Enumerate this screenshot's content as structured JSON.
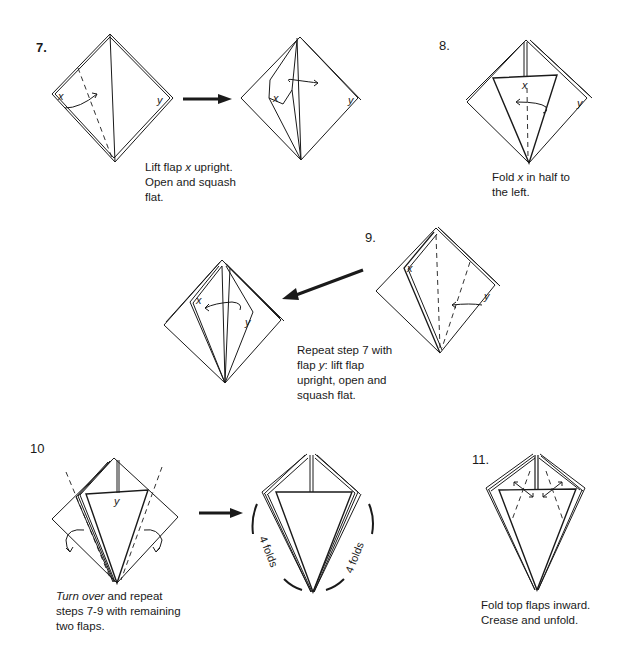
{
  "steps": [
    {
      "number": "7.",
      "caption_parts": [
        "Lift flap ",
        "x",
        " upright.",
        "Open and squash",
        "flat."
      ],
      "labels": {
        "x": "x",
        "y": "y"
      }
    },
    {
      "number": "8.",
      "caption_parts": [
        "Fold ",
        "x",
        " in half to",
        "the left."
      ],
      "labels": {
        "x": "x",
        "y": "y"
      }
    },
    {
      "number": "9.",
      "caption_parts": [
        "Repeat step 7 with",
        "flap ",
        "y",
        ": lift flap",
        "upright, open and",
        "squash flat."
      ],
      "labels": {
        "x": "x",
        "y": "y"
      }
    },
    {
      "number": "10",
      "caption_parts": [
        "Turn over",
        " and repeat",
        "steps 7-9 with remaining",
        "two flaps."
      ],
      "labels": {
        "y": "y",
        "left_folds": "4 folds",
        "right_folds": "4 folds"
      }
    },
    {
      "number": "11.",
      "caption_parts": [
        "Fold top flaps inward.",
        "Crease and unfold."
      ]
    }
  ],
  "colors": {
    "ink": "#1a1a1a",
    "paper": "#ffffff"
  }
}
